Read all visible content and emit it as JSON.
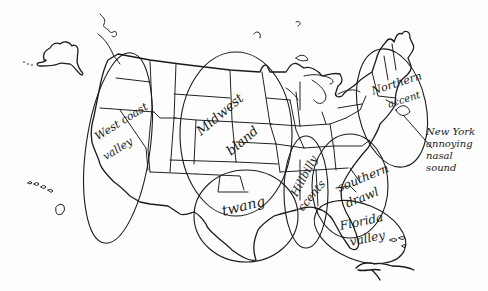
{
  "map": {
    "title": "",
    "style": "hand-drawn perceptual dialect map of the United States",
    "ink_color": "#1a1a1a",
    "background": "#fdfdfd",
    "regions": [
      {
        "id": "west-coast",
        "label_line1": "West coast",
        "label_line2": "valley"
      },
      {
        "id": "midwest",
        "label_line1": "Midwest",
        "label_line2": "bland"
      },
      {
        "id": "northern",
        "label_line1": "Northern",
        "label_line2": "accent"
      },
      {
        "id": "texas",
        "label_line1": "twang",
        "label_line2": ""
      },
      {
        "id": "hillbilly",
        "label_line1": "Hillbilly",
        "label_line2": "ccents"
      },
      {
        "id": "southern",
        "label_line1": "southern",
        "label_line2": "drawl"
      },
      {
        "id": "florida",
        "label_line1": "Florida",
        "label_line2": "valley"
      }
    ],
    "annotation": {
      "id": "new-york",
      "lines": [
        "New York",
        "annoying",
        "nasal",
        "sound"
      ]
    }
  }
}
